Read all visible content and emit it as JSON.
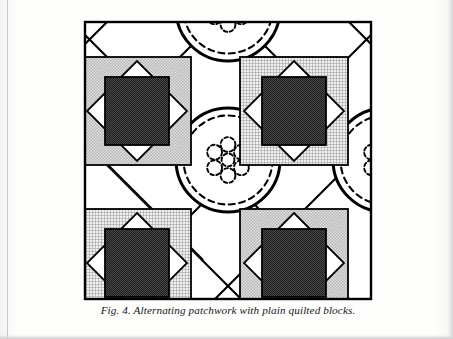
{
  "page": {
    "background_color": "#fcfcfb",
    "width": 453,
    "height": 339
  },
  "caption": {
    "text": "Fig. 4. Alternating patchwork with plain quilted blocks.",
    "figure_number": "Fig. 4.",
    "description": "Alternating patchwork with plain quilted blocks.",
    "style": "italic-serif"
  },
  "figure": {
    "title": "Alternating patchwork with plain quilted blocks",
    "frame": {
      "stroke_color": "#000000",
      "stroke_width": 2.2,
      "fill_color": "#ffffff",
      "x": 1,
      "y": 1,
      "width": 288,
      "height": 279
    },
    "palette": {
      "ink": "#000000",
      "background": "#ffffff",
      "light_gray_patch": "#c9c9c9",
      "crosshatch_patch": "#bdbdbd",
      "dark_patch": "#2b2b2b",
      "paper": "#fcfcfb"
    },
    "layout": {
      "type": "on-point alternating set",
      "cell_size": 108,
      "columns": 3,
      "rows": 3,
      "notes": "Pieced 'square-in-a-square' blocks alternate with plain blocks quilted with concentric circles and a central flower motif; long diagonals cross at each block corner forming setting triangles."
    },
    "patchwork_blocks": [
      {
        "id": "block-top-left",
        "position": "top-left",
        "corner_fill": "light-gray",
        "diamond_fill": "white",
        "center_fill": "dark",
        "clipped": false
      },
      {
        "id": "block-top-right",
        "position": "top-right",
        "corner_fill": "crosshatch",
        "diamond_fill": "white",
        "center_fill": "dark",
        "clipped": false
      },
      {
        "id": "block-bottom-left",
        "position": "bottom-left",
        "corner_fill": "crosshatch",
        "diamond_fill": "white",
        "center_fill": "dark",
        "clipped": true
      },
      {
        "id": "block-bottom-right",
        "position": "bottom-right",
        "corner_fill": "light-gray",
        "diamond_fill": "white",
        "center_fill": "dark",
        "clipped": true
      }
    ],
    "quilted_blocks": [
      {
        "id": "quilted-circle-top-center",
        "position": "top-center",
        "outer_ring": "solid",
        "inner_ring": "dashed",
        "motif": "dashed-flower-rosette",
        "clipped": "top"
      },
      {
        "id": "quilted-circle-center",
        "position": "center",
        "outer_ring": "solid",
        "inner_ring": "dashed",
        "motif": "dashed-flower-rosette",
        "clipped": "none"
      },
      {
        "id": "quilted-circle-middle-right",
        "position": "middle-right",
        "outer_ring": "solid",
        "inner_ring": "dashed",
        "motif": "dashed-flower-rosette",
        "clipped": "right"
      }
    ],
    "motif": {
      "name": "flower-rosette",
      "petal_count": 6,
      "stroke": "dashed",
      "has_center_circle": true
    }
  }
}
